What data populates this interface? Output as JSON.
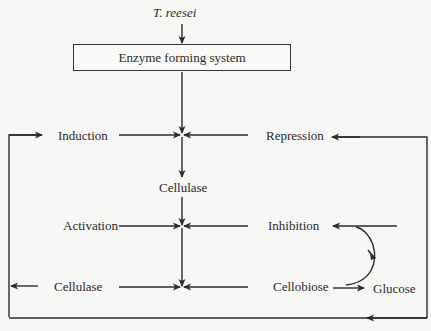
{
  "diagram": {
    "source_organism": "T. reesei",
    "box": {
      "label": "Enzyme forming system"
    },
    "nodes": {
      "induction": "Induction",
      "repression": "Repression",
      "cellulase_mid": "Cellulase",
      "activation": "Activation",
      "inhibition": "Inhibition",
      "cellulase_out": "Cellulase",
      "cellobiose": "Cellobiose",
      "glucose": "Glucose"
    },
    "edges": [
      {
        "from": "T. reesei",
        "to": "Enzyme forming system"
      },
      {
        "from": "Enzyme forming system",
        "to": "junction-1"
      },
      {
        "from": "Induction",
        "to": "junction-1"
      },
      {
        "from": "Repression",
        "to": "junction-1"
      },
      {
        "from": "junction-1",
        "to": "Cellulase"
      },
      {
        "from": "Cellulase",
        "to": "junction-2"
      },
      {
        "from": "Activation",
        "to": "junction-2"
      },
      {
        "from": "Inhibition",
        "to": "junction-2"
      },
      {
        "from": "junction-2",
        "to": "junction-3"
      },
      {
        "from": "Cellulase (left)",
        "to": "junction-3"
      },
      {
        "from": "Cellobiose",
        "to": "junction-3"
      },
      {
        "from": "Cellobiose",
        "to": "Glucose"
      },
      {
        "from": "Glucose pathway",
        "to": "Inhibition",
        "style": "curved"
      },
      {
        "from": "feedback loop",
        "to": "Induction"
      },
      {
        "from": "feedback loop",
        "to": "Repression"
      },
      {
        "from": "junction-3",
        "to": "Cellulase (left out)"
      }
    ],
    "colors": {
      "line": "#2b2b2b",
      "background": "#f7f7f5"
    }
  }
}
